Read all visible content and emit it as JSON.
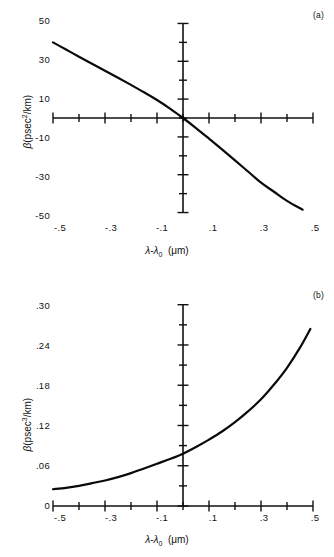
{
  "figure": {
    "background_color": "#ffffff",
    "line_color": "#0a0a0a",
    "axis_color": "#111111"
  },
  "panel_a": {
    "tag": "(a)",
    "y_axis_title_prefix": "β",
    "y_axis_title_rest": "(psec",
    "y_axis_title_exp": "2",
    "y_axis_title_suffix": "/km)",
    "x_axis_title_a": "λ",
    "x_axis_title_minus": "-",
    "x_axis_title_b": "λ",
    "x_axis_title_sub": "0",
    "x_axis_title_units": "(μm)",
    "y_ticks": [
      "50",
      "30",
      "10",
      "-10",
      "-30",
      "-50"
    ],
    "x_ticks": [
      "-.5",
      "-.3",
      "-.1",
      ".1",
      ".3",
      ".5"
    ]
  },
  "panel_b": {
    "tag": "(b)",
    "y_axis_title_prefix": "β",
    "y_axis_title_rest": "(psec",
    "y_axis_title_exp": "3",
    "y_axis_title_suffix": "/km)",
    "x_axis_title_a": "λ",
    "x_axis_title_minus": "-",
    "x_axis_title_b": "λ",
    "x_axis_title_sub": "0",
    "x_axis_title_units": "(μm)",
    "y_ticks": [
      ".30",
      ".24",
      ".18",
      ".12",
      ".06",
      "0"
    ],
    "x_ticks": [
      "-.5",
      "-.3",
      "-.1",
      ".1",
      ".3",
      ".5"
    ]
  },
  "chart_data": [
    {
      "type": "line",
      "panel": "a",
      "title": "",
      "xlabel": "λ-λ₀ (μm)",
      "ylabel": "β̈ (psec²/km)",
      "xlim": [
        -0.55,
        0.55
      ],
      "ylim": [
        -55,
        55
      ],
      "grid": false,
      "legend": "none",
      "xticks": [
        -0.5,
        -0.4,
        -0.3,
        -0.2,
        -0.1,
        0,
        0.1,
        0.2,
        0.3,
        0.4,
        0.5
      ],
      "xticklabels": [
        "-.5",
        "",
        "-.3",
        "",
        "-.1",
        "",
        ".1",
        "",
        ".3",
        "",
        ".5"
      ],
      "yticks": [
        -50,
        -40,
        -30,
        -20,
        -10,
        0,
        10,
        20,
        30,
        40,
        50
      ],
      "yticklabels": [
        "-50",
        "",
        "-30",
        "",
        "-10",
        "",
        "10",
        "",
        "30",
        "",
        "50"
      ],
      "x": [
        -0.5,
        -0.45,
        -0.4,
        -0.35,
        -0.3,
        -0.25,
        -0.2,
        -0.15,
        -0.1,
        -0.05,
        0.0,
        0.05,
        0.1,
        0.15,
        0.2,
        0.25,
        0.3,
        0.35,
        0.4,
        0.46
      ],
      "y": [
        40.0,
        36.2,
        32.4,
        28.7,
        25.0,
        21.3,
        17.5,
        13.6,
        9.5,
        5.0,
        0.0,
        -5.3,
        -10.9,
        -16.6,
        -22.4,
        -28.3,
        -34.2,
        -39.0,
        -43.8,
        -48.5
      ]
    },
    {
      "type": "line",
      "panel": "b",
      "title": "",
      "xlabel": "λ-λ₀ (μm)",
      "ylabel": "β⃛ (psec³/km)",
      "xlim": [
        -0.55,
        0.55
      ],
      "ylim": [
        0,
        0.31
      ],
      "grid": false,
      "legend": "none",
      "xticks": [
        -0.5,
        -0.4,
        -0.3,
        -0.2,
        -0.1,
        0,
        0.1,
        0.2,
        0.3,
        0.4,
        0.5
      ],
      "xticklabels": [
        "-.5",
        "",
        "-.3",
        "",
        "-.1",
        "",
        ".1",
        "",
        ".3",
        "",
        ".5"
      ],
      "yticks": [
        0,
        0.03,
        0.06,
        0.09,
        0.12,
        0.15,
        0.18,
        0.21,
        0.24,
        0.27,
        0.3
      ],
      "yticklabels": [
        "0",
        "",
        ".06",
        "",
        ".12",
        "",
        ".18",
        "",
        ".24",
        "",
        ".30"
      ],
      "x": [
        -0.5,
        -0.45,
        -0.4,
        -0.35,
        -0.3,
        -0.25,
        -0.2,
        -0.15,
        -0.1,
        -0.05,
        0.0,
        0.05,
        0.1,
        0.15,
        0.2,
        0.25,
        0.3,
        0.35,
        0.4,
        0.45,
        0.49
      ],
      "y": [
        0.025,
        0.027,
        0.03,
        0.034,
        0.038,
        0.043,
        0.049,
        0.056,
        0.063,
        0.07,
        0.078,
        0.088,
        0.099,
        0.111,
        0.125,
        0.141,
        0.159,
        0.181,
        0.206,
        0.236,
        0.264
      ]
    }
  ]
}
